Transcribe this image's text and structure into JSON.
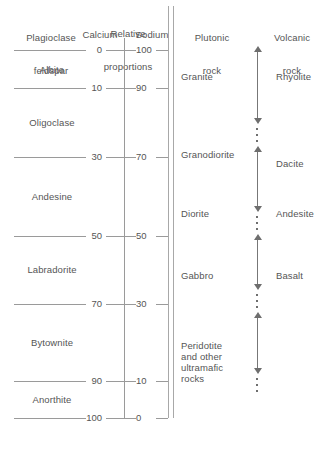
{
  "figure": {
    "background_color": "#ffffff",
    "line_color": "#9a9a9a",
    "text_color": "#555555"
  },
  "columns": {
    "mineral": {
      "header_line1": "Plagioclase",
      "header_line2": "feldspar"
    },
    "proportions": {
      "header_line1": "Relative",
      "header_line2": "proportions",
      "left_header": "Calcium",
      "right_header": "Sodium"
    },
    "plutonic": {
      "header_line1": "Plutonic",
      "header_line2": "rock"
    },
    "volcanic": {
      "header_line1": "Volcanic",
      "header_line2": "rock"
    }
  },
  "scale": {
    "calcium": [
      "0",
      "10",
      "30",
      "50",
      "70",
      "90",
      "100"
    ],
    "sodium": [
      "100",
      "90",
      "70",
      "50",
      "30",
      "10",
      "0"
    ]
  },
  "minerals": [
    {
      "name": "Albite",
      "calcium_range": "0-10",
      "sodium_range": "100-90"
    },
    {
      "name": "Oligoclase",
      "calcium_range": "10-30",
      "sodium_range": "90-70"
    },
    {
      "name": "Andesine",
      "calcium_range": "30-50",
      "sodium_range": "70-50"
    },
    {
      "name": "Labradorite",
      "calcium_range": "50-70",
      "sodium_range": "50-30"
    },
    {
      "name": "Bytownite",
      "calcium_range": "70-90",
      "sodium_range": "30-10"
    },
    {
      "name": "Anorthite",
      "calcium_range": "90-100",
      "sodium_range": "10-0"
    }
  ],
  "plutonic_rocks": [
    {
      "name": "Granite"
    },
    {
      "name": "Granodiorite"
    },
    {
      "name": "Diorite"
    },
    {
      "name": "Gabbro"
    },
    {
      "name": "Peridotite\nand other\nultramafic\nrocks"
    }
  ],
  "volcanic_rocks": [
    {
      "name": "Rhyolite"
    },
    {
      "name": "Dacite"
    },
    {
      "name": "Andesite"
    },
    {
      "name": "Basalt"
    }
  ]
}
